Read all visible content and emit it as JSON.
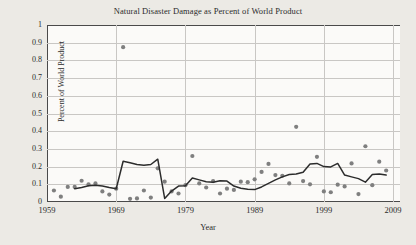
{
  "chart_data": {
    "type": "scatter",
    "title": "Natural Disaster Damage as Percent of World Product",
    "xlabel": "Year",
    "ylabel": "Percent of World Product",
    "xlim": [
      1959,
      2010
    ],
    "ylim": [
      0,
      1
    ],
    "grid": true,
    "legend": "none",
    "yticks": [
      "1",
      "0.9",
      "0.8",
      "0.7",
      "0.6",
      "0.5",
      "0.4",
      "0.3",
      "0.2",
      "0.1",
      "0"
    ],
    "ytick_values": [
      1,
      0.9,
      0.8,
      0.7,
      0.6,
      0.5,
      0.4,
      0.3,
      0.2,
      0.1,
      0
    ],
    "xticks": [
      "1959",
      "1969",
      "1979",
      "1989",
      "1999",
      "2009"
    ],
    "xtick_values": [
      1959,
      1969,
      1979,
      1989,
      1999,
      2009
    ],
    "series": [
      {
        "name": "Annual damage",
        "type": "scatter",
        "marker": "circle",
        "color": "#7f7f7f",
        "x": [
          1960,
          1961,
          1962,
          1963,
          1964,
          1965,
          1966,
          1967,
          1968,
          1969,
          1970,
          1971,
          1972,
          1973,
          1974,
          1975,
          1976,
          1977,
          1978,
          1979,
          1980,
          1981,
          1982,
          1983,
          1984,
          1985,
          1986,
          1987,
          1988,
          1989,
          1990,
          1991,
          1992,
          1993,
          1994,
          1995,
          1996,
          1997,
          1998,
          1999,
          2000,
          2001,
          2002,
          2003,
          2004,
          2005,
          2006,
          2007,
          2008
        ],
        "y": [
          0.065,
          0.03,
          0.085,
          0.085,
          0.12,
          0.1,
          0.105,
          0.06,
          0.042,
          0.075,
          0.875,
          0.018,
          0.02,
          0.065,
          0.025,
          0.19,
          0.115,
          0.06,
          0.048,
          0.095,
          0.26,
          0.105,
          0.082,
          0.118,
          0.048,
          0.075,
          0.068,
          0.115,
          0.112,
          0.128,
          0.17,
          0.215,
          0.152,
          0.148,
          0.105,
          0.425,
          0.118,
          0.1,
          0.255,
          0.06,
          0.055,
          0.098,
          0.088,
          0.218,
          0.045,
          0.315,
          0.095,
          0.228,
          0.178
        ]
      },
      {
        "name": "Moving average trend",
        "type": "line",
        "color": "#2c2c2c",
        "x": [
          1963,
          1964,
          1965,
          1966,
          1967,
          1968,
          1969,
          1970,
          1971,
          1972,
          1973,
          1974,
          1975,
          1976,
          1977,
          1978,
          1979,
          1980,
          1981,
          1982,
          1983,
          1984,
          1985,
          1986,
          1987,
          1988,
          1989,
          1990,
          1991,
          1992,
          1993,
          1994,
          1995,
          1996,
          1997,
          1998,
          1999,
          2000,
          2001,
          2002,
          2003,
          2004,
          2005,
          2006,
          2007,
          2008
        ],
        "y": [
          0.075,
          0.082,
          0.092,
          0.095,
          0.09,
          0.082,
          0.075,
          0.23,
          0.222,
          0.212,
          0.208,
          0.212,
          0.242,
          0.02,
          0.062,
          0.09,
          0.092,
          0.135,
          0.125,
          0.115,
          0.112,
          0.12,
          0.118,
          0.09,
          0.078,
          0.072,
          0.07,
          0.085,
          0.105,
          0.125,
          0.142,
          0.155,
          0.158,
          0.168,
          0.215,
          0.218,
          0.2,
          0.198,
          0.218,
          0.152,
          0.142,
          0.132,
          0.112,
          0.155,
          0.158,
          0.152
        ]
      }
    ]
  }
}
